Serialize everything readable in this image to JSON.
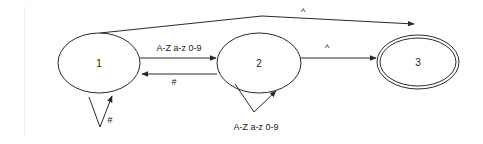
{
  "diagram": {
    "type": "finite-state-automaton",
    "colors": {
      "stroke": "#2a2a2a",
      "text": "#222222",
      "background": "#ffffff"
    },
    "states": [
      {
        "id": "1",
        "label": "1",
        "accepting": false
      },
      {
        "id": "2",
        "label": "2",
        "accepting": false
      },
      {
        "id": "3",
        "label": "3",
        "accepting": true
      }
    ],
    "transitions": [
      {
        "from": "1",
        "to": "2",
        "label": "A-Z a-z 0-9"
      },
      {
        "from": "2",
        "to": "1",
        "label": "#"
      },
      {
        "from": "1",
        "to": "1",
        "label": "#"
      },
      {
        "from": "2",
        "to": "2",
        "label": "A-Z a-z 0-9"
      },
      {
        "from": "2",
        "to": "3",
        "label": "^"
      },
      {
        "from": "1",
        "to": "3",
        "label": "^"
      }
    ]
  }
}
